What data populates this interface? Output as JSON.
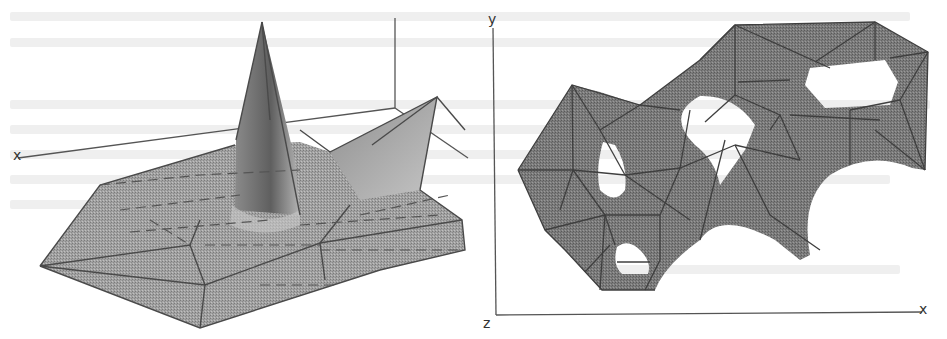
{
  "figure": {
    "panels": [
      {
        "id": "left",
        "description": "3D triangulated surface with a tall central spike and a secondary peak at right",
        "axis_labels": {
          "x": "x"
        }
      },
      {
        "id": "right",
        "description": "Top-down view of a planar triangulated mesh with four holes",
        "axis_labels": {
          "y": "y",
          "z": "z",
          "x": "x"
        }
      }
    ],
    "colors": {
      "mesh_fill": "#9a9a9a",
      "mesh_dark": "#6e6e6e",
      "mesh_light": "#bdbdbd",
      "edge": "#4a4a4a",
      "axis": "#555555",
      "bleed_text": "#efefef"
    }
  }
}
